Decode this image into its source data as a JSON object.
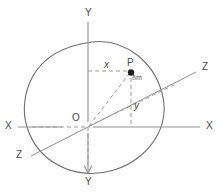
{
  "figure": {
    "type": "physics-diagram",
    "colors": {
      "outline": "#6e6e6e",
      "axis": "#8a8a8a",
      "dashed": "#9a9a9a",
      "label": "#4a4a4a",
      "point": "#1a1a1a",
      "background": "#ffffff"
    },
    "axes": [
      {
        "id": "y-top",
        "label": "Y",
        "x": 85,
        "y": 12
      },
      {
        "id": "y-bottom",
        "label": "Y",
        "x": 85,
        "y": 178
      },
      {
        "id": "x-left",
        "label": "X",
        "x": 6,
        "y": 122
      },
      {
        "id": "x-right",
        "label": "X",
        "x": 207,
        "y": 122
      },
      {
        "id": "z-upper-right",
        "label": "Z",
        "x": 202,
        "y": 63
      },
      {
        "id": "z-lower-left",
        "label": "Z",
        "x": 17,
        "y": 150
      }
    ],
    "points": [
      {
        "id": "origin",
        "label": "O",
        "x": 72,
        "y": 112
      },
      {
        "id": "point-p",
        "label": "P",
        "x": 127,
        "y": 62
      },
      {
        "id": "mass-element",
        "label": "δm",
        "x": 131,
        "y": 77
      }
    ],
    "distances": [
      {
        "id": "x-distance",
        "label": "x",
        "x": 104,
        "y": 62
      },
      {
        "id": "y-distance",
        "label": "y",
        "x": 134,
        "y": 103
      }
    ],
    "geometry": {
      "origin_px": {
        "x": 88,
        "y": 127
      },
      "point_p_px": {
        "x": 131,
        "y": 77
      },
      "x_axis_y_px": 127,
      "y_axis_x_px": 88,
      "lamina_path": "M 88 41 C 104 36 120 38 134 47 C 150 57 158 72 161 88 C 165 106 164 120 159 135 C 152 155 136 168 116 172 C 94 177 70 173 53 162 C 36 151 25 134 22 116 C 19 97 25 78 38 63 C 51 48 70 44 88 41 Z"
    }
  }
}
